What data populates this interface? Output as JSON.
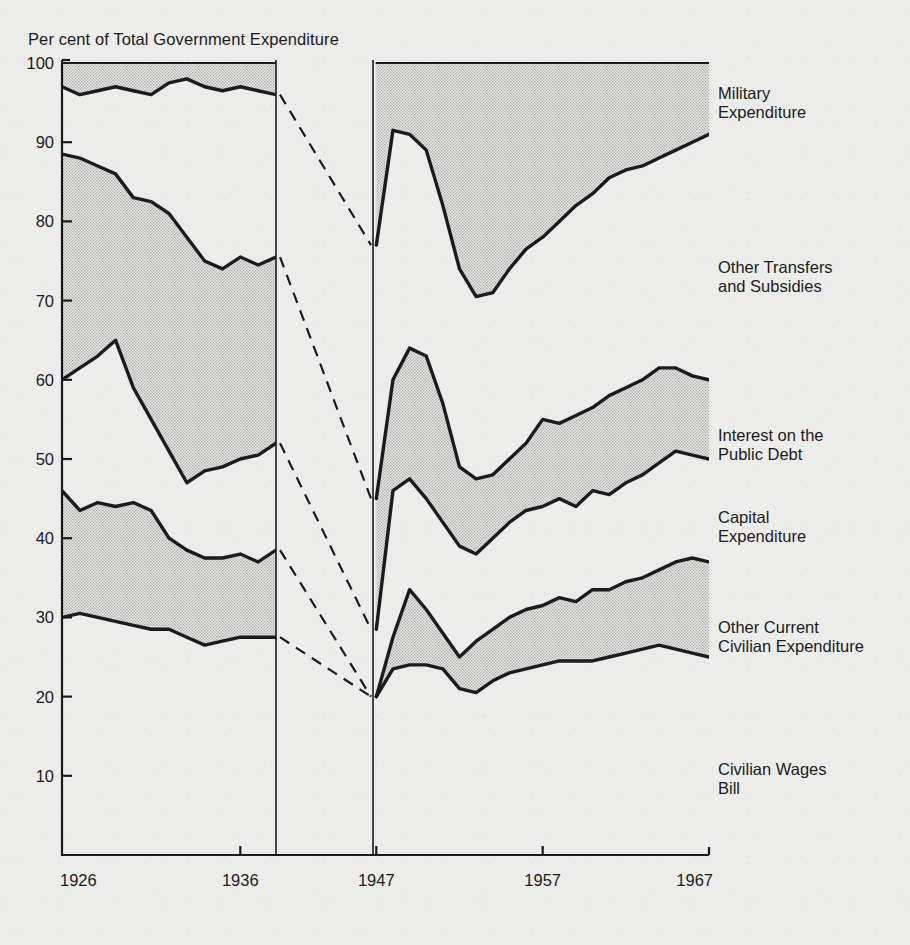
{
  "chart": {
    "title": "Per cent of Total Government Expenditure",
    "ylabel": "Per cent of Total Government Expenditure",
    "y_ticks": [
      "10",
      "20",
      "30",
      "40",
      "50",
      "60",
      "70",
      "80",
      "90",
      "100"
    ],
    "x_ticks": [
      "1926",
      "1936",
      "1947",
      "1957",
      "1967"
    ],
    "ink_color": "#1b1b1b",
    "band_fill": "#c9c9c7",
    "paper_color": "#ececeb"
  },
  "series_labels": [
    {
      "id": "military-expenditure",
      "text": "Military\nExpenditure",
      "x": 718,
      "y": 84
    },
    {
      "id": "other-transfers-and-subsidies",
      "text": "Other Transfers\nand Subsidies",
      "x": 718,
      "y": 258
    },
    {
      "id": "interest-on-the-public-debt",
      "text": "Interest on the\nPublic Debt",
      "x": 718,
      "y": 426
    },
    {
      "id": "capital-expenditure",
      "text": "Capital\nExpenditure",
      "x": 718,
      "y": 508
    },
    {
      "id": "other-current-civilian-expenditure",
      "text": "Other Current\nCivilian Expenditure",
      "x": 718,
      "y": 618
    },
    {
      "id": "civilian-wages-bill",
      "text": "Civilian Wages\nBill",
      "x": 718,
      "y": 760
    }
  ],
  "chart_data": {
    "type": "area",
    "title": "Per cent of Total Government Expenditure",
    "xlabel": "",
    "ylabel": "Per cent of Total Government Expenditure",
    "ylim": [
      0,
      100
    ],
    "grid": false,
    "legend": "right-inline-labels",
    "note": "Stacked cumulative shares of total UK government expenditure. Two panels separated by a WWII gap (1939-1946); dashed connector lines bridge the gap for four of the cumulative boundaries.",
    "panels": [
      {
        "name": "pre-war",
        "xlim": [
          1926,
          1938
        ],
        "x": [
          1926,
          1927,
          1928,
          1929,
          1930,
          1931,
          1932,
          1933,
          1934,
          1935,
          1936,
          1937,
          1938
        ]
      },
      {
        "name": "post-war",
        "xlim": [
          1946.8,
          1967
        ],
        "x": [
          1947,
          1948,
          1949,
          1950,
          1951,
          1952,
          1953,
          1954,
          1955,
          1956,
          1957,
          1958,
          1959,
          1960,
          1961,
          1962,
          1963,
          1964,
          1965,
          1966,
          1967
        ]
      }
    ],
    "boundaries": [
      {
        "name": "top of Military Expenditure band (cumulative total incl. military)",
        "pre_war": [
          100,
          100,
          100,
          100,
          100,
          100,
          100,
          100,
          100,
          100,
          100,
          100,
          100
        ],
        "post_war": [
          100,
          100,
          100,
          100,
          100,
          100,
          100,
          100,
          100,
          100,
          100,
          100,
          100,
          100,
          100,
          100,
          100,
          100,
          100,
          100,
          100
        ]
      },
      {
        "name": "Military Expenditure lower boundary",
        "pre_war": [
          97,
          96,
          96.5,
          97,
          96.5,
          96,
          97.5,
          98,
          97,
          96.5,
          97,
          96.5,
          96
        ],
        "post_war": [
          77,
          91.5,
          91,
          89,
          82,
          74,
          70.5,
          71,
          74,
          76.5,
          78,
          80,
          82,
          83.5,
          85.5,
          86.5,
          87,
          88,
          89,
          90,
          91
        ]
      },
      {
        "name": "Other Transfers and Subsidies lower boundary",
        "pre_war": [
          88.5,
          88,
          87,
          86,
          83,
          82.5,
          81,
          78,
          75,
          74,
          75.5,
          74.5,
          75.5
        ],
        "post_war": [
          45,
          60,
          64,
          63,
          57,
          49,
          47.5,
          48,
          50,
          52,
          55,
          54.5,
          55.5,
          56.5,
          58,
          59,
          60,
          61.5,
          61.5,
          60.5,
          60
        ]
      },
      {
        "name": "Interest on the Public Debt lower boundary",
        "pre_war": [
          60,
          61.5,
          63,
          65,
          59,
          55,
          51,
          47,
          48.5,
          49,
          50,
          50.5,
          52
        ],
        "post_war": [
          28.5,
          46,
          47.5,
          45,
          42,
          39,
          38,
          40,
          42,
          43.5,
          44,
          45,
          44,
          46,
          45.5,
          47,
          48,
          49.5,
          51,
          50.5,
          50
        ]
      },
      {
        "name": "Capital Expenditure lower boundary",
        "pre_war": [
          46,
          43.5,
          44.5,
          44,
          44.5,
          43.5,
          40,
          38.5,
          37.5,
          37.5,
          38,
          37,
          38.5
        ],
        "post_war": [
          20,
          27.5,
          33.5,
          31,
          28,
          25,
          27,
          28.5,
          30,
          31,
          31.5,
          32.5,
          32,
          33.5,
          33.5,
          34.5,
          35,
          36,
          37,
          37.5,
          37
        ]
      },
      {
        "name": "Other Current Civilian Expenditure lower boundary (= top of Civilian Wages Bill)",
        "pre_war": [
          30,
          30.5,
          30,
          29.5,
          29,
          28.5,
          28.5,
          27.5,
          26.5,
          27,
          27.5,
          27.5,
          27.5
        ],
        "post_war": [
          20,
          23.5,
          24,
          24,
          23.5,
          21,
          20.5,
          22,
          23,
          23.5,
          24,
          24.5,
          24.5,
          24.5,
          25,
          25.5,
          26,
          26.5,
          26,
          25.5,
          25
        ]
      }
    ],
    "bands": [
      {
        "name": "Military Expenditure",
        "shaded": true,
        "between": [
          "top",
          "Military Expenditure lower boundary"
        ]
      },
      {
        "name": "Other Transfers and Subsidies",
        "shaded": false,
        "between": [
          "Military Expenditure lower boundary",
          "Other Transfers and Subsidies lower boundary"
        ]
      },
      {
        "name": "Interest on the Public Debt",
        "shaded": true,
        "between": [
          "Other Transfers and Subsidies lower boundary",
          "Interest on the Public Debt lower boundary"
        ]
      },
      {
        "name": "Capital Expenditure",
        "shaded": false,
        "between": [
          "Interest on the Public Debt lower boundary",
          "Capital Expenditure lower boundary"
        ]
      },
      {
        "name": "Other Current Civilian Expenditure",
        "shaded": true,
        "between": [
          "Capital Expenditure lower boundary",
          "Other Current Civilian Expenditure lower boundary"
        ]
      },
      {
        "name": "Civilian Wages Bill",
        "shaded": false,
        "between": [
          "Other Current Civilian Expenditure lower boundary",
          "zero"
        ]
      }
    ],
    "connectors": [
      {
        "from_value": 96,
        "to_value": 77,
        "style": "dashed"
      },
      {
        "from_value": 75.5,
        "to_value": 45,
        "style": "dashed"
      },
      {
        "from_value": 52,
        "to_value": 28.5,
        "style": "dashed"
      },
      {
        "from_value": 38.5,
        "to_value": 20,
        "style": "dashed"
      },
      {
        "from_value": 27.5,
        "to_value": 20,
        "style": "dashed"
      }
    ]
  }
}
